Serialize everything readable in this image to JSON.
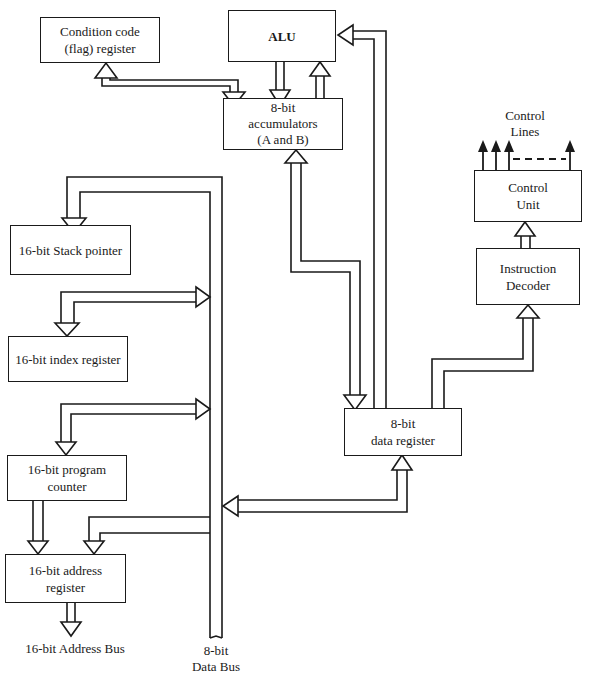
{
  "diagram": {
    "blocks": {
      "flag_register": {
        "line1": "Condition code",
        "line2": "(flag) register"
      },
      "alu": {
        "label": "ALU"
      },
      "accumulators": {
        "line1": "8-bit",
        "line2": "accumulators",
        "line3": "(A and B)"
      },
      "control_unit": {
        "line1": "Control",
        "line2": "Unit"
      },
      "instruction_decoder": {
        "line1": "Instruction",
        "line2": "Decoder"
      },
      "stack_pointer": {
        "label": "16-bit Stack pointer"
      },
      "index_register": {
        "label": "16-bit index register"
      },
      "program_counter": {
        "line1": "16-bit program",
        "line2": "counter"
      },
      "address_register": {
        "line1": "16-bit address",
        "line2": "register"
      },
      "data_register": {
        "line1": "8-bit",
        "line2": "data register"
      }
    },
    "labels": {
      "control_lines": {
        "line1": "Control",
        "line2": "Lines"
      },
      "address_bus": "16-bit Address Bus",
      "data_bus": {
        "line1": "8-bit",
        "line2": "Data Bus"
      }
    },
    "connections": [
      {
        "from": "flag_register",
        "to": "accumulators",
        "type": "bidirectional"
      },
      {
        "from": "alu",
        "to": "accumulators",
        "type": "unidirectional"
      },
      {
        "from": "accumulators",
        "to": "alu",
        "type": "unidirectional"
      },
      {
        "from": "data_register",
        "to": "alu",
        "type": "unidirectional"
      },
      {
        "from": "accumulators",
        "to": "data_register",
        "type": "bidirectional"
      },
      {
        "from": "data_register",
        "to": "instruction_decoder",
        "type": "unidirectional"
      },
      {
        "from": "instruction_decoder",
        "to": "control_unit",
        "type": "unidirectional"
      },
      {
        "from": "control_unit",
        "to": "control_lines",
        "type": "output"
      },
      {
        "from": "data_bus",
        "to": "stack_pointer",
        "type": "unidirectional"
      },
      {
        "from": "index_register",
        "to": "data_bus",
        "type": "bidirectional"
      },
      {
        "from": "program_counter",
        "to": "data_bus",
        "type": "bidirectional"
      },
      {
        "from": "program_counter",
        "to": "address_register",
        "type": "unidirectional"
      },
      {
        "from": "data_bus",
        "to": "address_register",
        "type": "unidirectional"
      },
      {
        "from": "data_register",
        "to": "data_bus",
        "type": "bidirectional"
      },
      {
        "from": "address_register",
        "to": "address_bus",
        "type": "output"
      }
    ]
  }
}
